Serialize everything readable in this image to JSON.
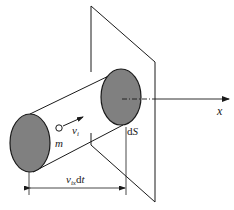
{
  "diagram": {
    "labels": {
      "axis": "x",
      "surface": "dS",
      "surface_d": "d",
      "surface_S": "S",
      "mass": "m",
      "velocity_v": "v",
      "velocity_sub": "i",
      "length_v": "v",
      "length_sub": "ix",
      "length_d": "d",
      "length_t": "t"
    },
    "colors": {
      "stroke": "#1a1a1a",
      "fill_ellipse": "#808080",
      "background": "#ffffff"
    }
  }
}
